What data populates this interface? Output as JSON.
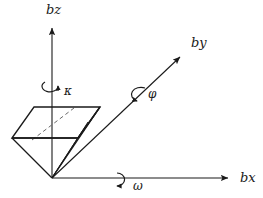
{
  "figure": {
    "kind": "3d-axes-rotation-diagram",
    "background_color": "#ffffff",
    "ink_color": "#1a1a1a",
    "hidden_line_color": "#6a6a6a"
  },
  "axes": [
    {
      "id": "bz",
      "label": "bz",
      "description": "vertical body z axis pointing up",
      "arrow": "up",
      "label_x": 46,
      "label_y": 14
    },
    {
      "id": "by",
      "label": "by",
      "description": "body y axis pointing up and to the right",
      "arrow": "up-right",
      "label_x": 191,
      "label_y": 47
    },
    {
      "id": "bx",
      "label": "bx",
      "description": "horizontal body x axis pointing right",
      "arrow": "right",
      "label_x": 240,
      "label_y": 182
    }
  ],
  "rotations": [
    {
      "id": "kappa",
      "label": "κ",
      "about_axis": "bz",
      "description": "rotation about the bz axis",
      "label_x": 64,
      "label_y": 95
    },
    {
      "id": "phi",
      "label": "φ",
      "about_axis": "by",
      "description": "rotation about the by axis",
      "label_x": 148,
      "label_y": 98
    },
    {
      "id": "omega",
      "label": "ω",
      "about_axis": "bx",
      "description": "rotation about the bx axis",
      "label_x": 133,
      "label_y": 190
    }
  ],
  "body": {
    "name": "wedge-prism",
    "description": "wedge / pyramid body shape with top parallelogram face and apex at the origin",
    "hidden_edge": "dashed diagonal across top face"
  }
}
